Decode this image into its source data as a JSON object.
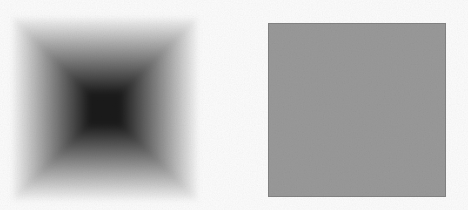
{
  "figure": {
    "kind": "two-square grayscale stimulus figure",
    "left_square": {
      "style": "blurred-edge dark square with square-pyramid shading and diagonal corner seams",
      "center_color": "#1a1a1a",
      "edge_color": "#ffffff"
    },
    "right_square": {
      "style": "uniform gray square with crisp edges",
      "fill_color": "#9a9a9a"
    },
    "background": {
      "color": "#fdfdfd",
      "texture": "fine film grain / scan noise"
    }
  },
  "colors": {
    "canvas-bg": "#fdfdfd",
    "blur-center": "#1a1a1a",
    "blur-edge": "#ffffff",
    "uniform-fill": "#9a9a9a"
  }
}
